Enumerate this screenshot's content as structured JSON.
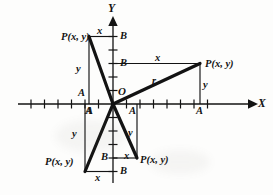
{
  "figure": {
    "width": 273,
    "height": 195,
    "background": "#fdfdfc",
    "ink": "#131313"
  },
  "axes": {
    "x_label": "X",
    "y_label": "Y",
    "origin_label": "O",
    "origin": {
      "x": 113,
      "y": 104
    },
    "x_axis": {
      "start_x": 18,
      "end_x": 252,
      "y": 104,
      "tick_spacing": 13.5,
      "arrow": "right"
    },
    "y_axis": {
      "start_y": 183,
      "end_y": 19,
      "x": 113,
      "tick_spacing": 13.5,
      "arrow": "up"
    }
  },
  "points": [
    {
      "id": "p-quadrant-2",
      "label": "P(x, y)",
      "quadrant": 2
    },
    {
      "id": "p-quadrant-1",
      "label": "P(x, y)",
      "quadrant": 1
    },
    {
      "id": "p-quadrant-3",
      "label": "P(x, y)",
      "quadrant": 3
    },
    {
      "id": "p-quadrant-4",
      "label": "P(x, y)",
      "quadrant": 4
    }
  ],
  "segment_labels": {
    "radius": "r",
    "horizontal_leg": "x",
    "vertical_leg": "y",
    "x_foot": "A",
    "y_foot": "B"
  },
  "annotations": {
    "q2": {
      "x": "x",
      "y": "y",
      "foot_x_upper": "A",
      "foot_x_lower": "A",
      "foot_y": "B"
    },
    "q1": {
      "x": "x",
      "y": "y",
      "r": "r",
      "foot_x": "A",
      "foot_y": "B"
    },
    "q3": {
      "x": "x",
      "y": "y",
      "foot_x": "A",
      "foot_y": "B"
    },
    "q4": {
      "x": "x",
      "y": "y",
      "foot_x": "A",
      "foot_y": "B"
    }
  }
}
